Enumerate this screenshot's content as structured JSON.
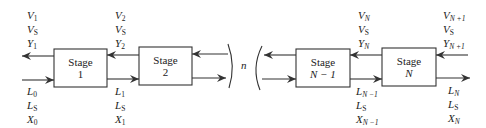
{
  "diagram": {
    "type": "countercurrent multistage cascade",
    "stages": [
      {
        "id": "stage-1",
        "label": "Stage",
        "number": "1"
      },
      {
        "id": "stage-2",
        "label": "Stage",
        "number": "2"
      },
      {
        "id": "stage-n-minus-1",
        "label": "Stage",
        "number": "N − 1"
      },
      {
        "id": "stage-n",
        "label": "Stage",
        "number": "N"
      }
    ],
    "break_label": "n",
    "streams": {
      "v1": {
        "lines": [
          {
            "sym": "V",
            "sub": "1"
          },
          {
            "sym": "V",
            "sub": "S"
          },
          {
            "sym": "Y",
            "sub": "1"
          }
        ]
      },
      "v2": {
        "lines": [
          {
            "sym": "V",
            "sub": "2"
          },
          {
            "sym": "V",
            "sub": "S"
          },
          {
            "sym": "Y",
            "sub": "2"
          }
        ]
      },
      "vN": {
        "lines": [
          {
            "sym": "V",
            "sub": "N"
          },
          {
            "sym": "V",
            "sub": "S"
          },
          {
            "sym": "Y",
            "sub": "N"
          }
        ]
      },
      "vN1": {
        "lines": [
          {
            "sym": "V",
            "sub": "N +1"
          },
          {
            "sym": "V",
            "sub": "S"
          },
          {
            "sym": "Y",
            "sub": "N +1"
          }
        ]
      },
      "l0": {
        "lines": [
          {
            "sym": "L",
            "sub": "0"
          },
          {
            "sym": "L",
            "sub": "S"
          },
          {
            "sym": "X",
            "sub": "0"
          }
        ]
      },
      "l1": {
        "lines": [
          {
            "sym": "L",
            "sub": "1"
          },
          {
            "sym": "L",
            "sub": "S"
          },
          {
            "sym": "X",
            "sub": "1"
          }
        ]
      },
      "lN1": {
        "lines": [
          {
            "sym": "L",
            "sub": "N −1"
          },
          {
            "sym": "L",
            "sub": "S"
          },
          {
            "sym": "X",
            "sub": "N −1"
          }
        ]
      },
      "lN": {
        "lines": [
          {
            "sym": "L",
            "sub": "N"
          },
          {
            "sym": "L",
            "sub": "S"
          },
          {
            "sym": "X",
            "sub": "N"
          }
        ]
      }
    },
    "colors": {
      "line": "#333333",
      "text": "#222222",
      "background": "#ffffff"
    }
  }
}
